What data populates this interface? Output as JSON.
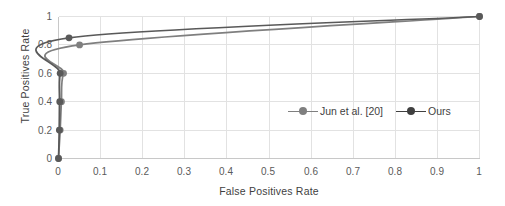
{
  "chart_data": {
    "type": "line",
    "title": "",
    "xlabel": "False Positives Rate",
    "ylabel": "True Positives Rate",
    "xlim": [
      0,
      1
    ],
    "ylim": [
      0,
      1
    ],
    "xticks": [
      "0",
      "0.1",
      "0.2",
      "0.3",
      "0.4",
      "0.5",
      "0.6",
      "0.7",
      "0.8",
      "0.9",
      "1"
    ],
    "yticks": [
      "0",
      "0.2",
      "0.4",
      "0.6",
      "0.8",
      "1"
    ],
    "xtick_values": [
      0,
      0.1,
      0.2,
      0.3,
      0.4,
      0.5,
      0.6,
      0.7,
      0.8,
      0.9,
      1
    ],
    "ytick_values": [
      0,
      0.2,
      0.4,
      0.6,
      0.8,
      1
    ],
    "grid": "vertical-and-horizontal-light",
    "legend_position": "inside-lower-right",
    "series": [
      {
        "name": "Jun et al. [20]",
        "color": "#7f7f7f",
        "marker": "circle",
        "x": [
          0.0,
          0.004,
          0.007,
          0.012,
          0.05,
          1.0
        ],
        "y": [
          0.0,
          0.2,
          0.4,
          0.6,
          0.8,
          1.0
        ]
      },
      {
        "name": "Ours",
        "color": "#595959",
        "marker": "circle",
        "x": [
          0.0,
          0.002,
          0.003,
          0.004,
          0.025,
          1.0
        ],
        "y": [
          0.0,
          0.2,
          0.4,
          0.6,
          0.85,
          1.0
        ]
      }
    ]
  },
  "legend": {
    "items": [
      {
        "label": "Jun et al. [20]",
        "color": "#7f7f7f"
      },
      {
        "label": "Ours",
        "color": "#404040"
      }
    ]
  },
  "axes": {
    "x_title": "False Positives Rate",
    "y_title": "True Positives Rate"
  },
  "colors": {
    "background": "#ffffff",
    "grid": "#e2e2e2",
    "axis": "#c8c8c8",
    "text": "#4a4a4a",
    "series_jun": "#7f7f7f",
    "series_ours": "#4a4a4a"
  }
}
